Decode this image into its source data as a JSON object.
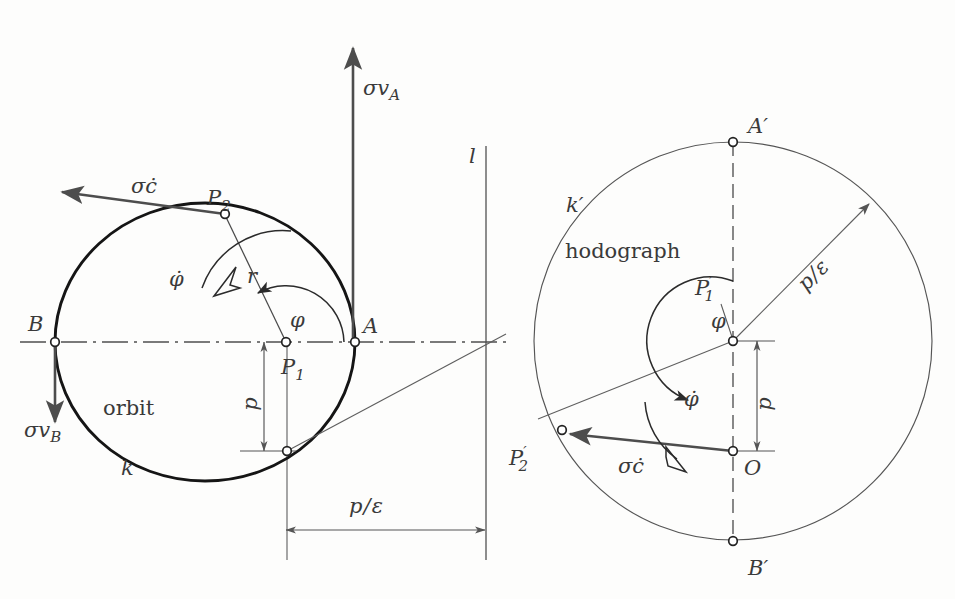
{
  "figure": {
    "background_color": "#fdfdfc",
    "ink_color": "#2b2b2b"
  },
  "left_panel": {
    "name": "orbit-diagram",
    "curve_label": "k",
    "curve_caption": "orbit",
    "focus_label": "P₁",
    "focus_label_text": "P",
    "focus_sub": "1",
    "point_a": "A",
    "point_b": "B",
    "point_p2_text": "P",
    "point_p2_sub": "2",
    "radius_label": "r",
    "angle_label": "φ",
    "angle_rate_label": "φ̇",
    "directrix_label": "l",
    "velocity_a": "σv",
    "velocity_a_sub": "A",
    "velocity_b": "σv",
    "velocity_b_sub": "B",
    "c_dot_vector": "σċ",
    "dim_p": "p",
    "dim_p_over_eps_num": "p",
    "dim_p_over_eps_den": "ε",
    "dim_p_over_eps": "p/ε"
  },
  "right_panel": {
    "name": "hodograph-diagram",
    "curve_label": "k′",
    "curve_caption": "hodograph",
    "center_label_text": "P",
    "center_label_sub": "1",
    "center_label_prime": "′",
    "point_a_prime": "A′",
    "point_b_prime": "B′",
    "point_o": "O",
    "point_p2_prime_text": "P",
    "point_p2_prime_sub": "2",
    "point_p2_prime_prime": "′",
    "angle_label": "φ",
    "angle_rate_label": "φ̇",
    "radius_label_num": "p",
    "radius_label_den": "ε",
    "radius_label": "p/ε",
    "dim_p": "p",
    "c_dot_vector": "σċ"
  },
  "geometry": {
    "orbit": {
      "type": "ellipse",
      "center_x": 205,
      "center_y": 342,
      "rx": 150,
      "ry": 139,
      "focus_x": 286,
      "focus_y": 342,
      "apoapsis_x": 55,
      "periapsis_x": 355,
      "p2_x": 225,
      "p2_y": 215,
      "semi_latus_point_x": 287,
      "semi_latus_point_y": 451
    },
    "hodograph": {
      "type": "circle",
      "center_x": 733,
      "center_y": 341,
      "r": 199,
      "o_x": 733,
      "o_y": 451,
      "p2p_x": 562,
      "p2p_y": 432,
      "a_prime_y": 142,
      "b_prime_y": 540
    },
    "directrix_x": 486,
    "dim_p_left_x": 264,
    "dim_p_right_x": 757,
    "dim_peps_y": 530,
    "dim_peps_x1": 286,
    "dim_peps_x2": 485
  }
}
